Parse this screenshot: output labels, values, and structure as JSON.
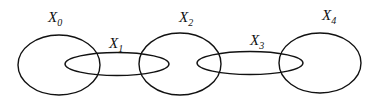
{
  "diagram": {
    "type": "overlapping-sets-chain",
    "sets": [
      {
        "name": "X",
        "subscript": "0",
        "kind": "large",
        "cx": 59,
        "cy": 65,
        "rx": 41,
        "ry": 30,
        "label_x": 48,
        "label_y": 22
      },
      {
        "name": "X",
        "subscript": "1",
        "kind": "small",
        "cx": 117,
        "cy": 64,
        "rx": 52,
        "ry": 11.5,
        "label_x": 109,
        "label_y": 48
      },
      {
        "name": "X",
        "subscript": "2",
        "kind": "large",
        "cx": 180,
        "cy": 64,
        "rx": 41,
        "ry": 31,
        "label_x": 179,
        "label_y": 22
      },
      {
        "name": "X",
        "subscript": "3",
        "kind": "small",
        "cx": 250,
        "cy": 63,
        "rx": 53,
        "ry": 11.5,
        "label_x": 250,
        "label_y": 45
      },
      {
        "name": "X",
        "subscript": "4",
        "kind": "large",
        "cx": 320,
        "cy": 63,
        "rx": 41,
        "ry": 30,
        "label_x": 322,
        "label_y": 20
      }
    ],
    "stroke_color": "#111111",
    "background": "#ffffff"
  }
}
